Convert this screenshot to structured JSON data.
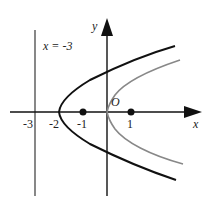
{
  "diagram": {
    "axes": {
      "x_label": "x",
      "y_label": "y",
      "origin_label": "O"
    },
    "ticks": [
      {
        "value": -3,
        "label": "-3"
      },
      {
        "value": -2,
        "label": "-2"
      },
      {
        "value": -1,
        "label": "-1"
      },
      {
        "value": 1,
        "label": "1"
      }
    ],
    "points": [
      {
        "name": "point-neg1",
        "x": -1,
        "y": 0
      },
      {
        "name": "point-1",
        "x": 1,
        "y": 0
      }
    ],
    "line": {
      "label": "x = -3",
      "equation": "x = -3"
    },
    "curves": [
      {
        "name": "parabola-black",
        "vertex": [
          -2,
          0
        ],
        "color": "#111111"
      },
      {
        "name": "parabola-gray",
        "vertex": [
          0,
          0
        ],
        "color": "#888888"
      }
    ]
  }
}
